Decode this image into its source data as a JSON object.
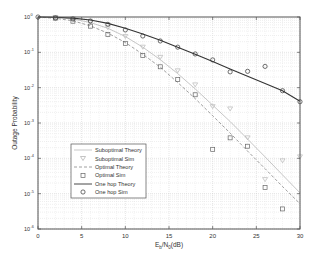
{
  "chart_data": {
    "type": "line",
    "title": "",
    "xlabel": "E_b/N_0(dB)",
    "ylabel": "Outage Probability",
    "xlim": [
      0,
      30
    ],
    "ylim_log10": [
      -6,
      0
    ],
    "yscale": "log",
    "grid": true,
    "legend_position": "lower left (inside)",
    "x_ticks": [
      0,
      5,
      10,
      15,
      20,
      25,
      30
    ],
    "y_ticks": [
      "10^0",
      "10^-1",
      "10^-2",
      "10^-3",
      "10^-4",
      "10^-5",
      "10^-6"
    ],
    "series": [
      {
        "name": "Suboptimal Theory",
        "style": "solid-light",
        "color": "#b8b8b8",
        "x": [
          0,
          2,
          4,
          6,
          8,
          10,
          12,
          14,
          16,
          18,
          20,
          22,
          24,
          26,
          28,
          30
        ],
        "y": [
          1.0,
          0.97,
          0.88,
          0.7,
          0.48,
          0.28,
          0.14,
          0.062,
          0.025,
          0.0092,
          0.0032,
          0.0011,
          0.00035,
          0.00011,
          3.4e-05,
          1.05e-05
        ]
      },
      {
        "name": "Suboptimal Sim",
        "style": "marker-triangle-down",
        "color": "#b8b8b8",
        "x": [
          2,
          4,
          6,
          8,
          10,
          12,
          14,
          16,
          18,
          20,
          22,
          24,
          26,
          28,
          30
        ],
        "y": [
          0.97,
          0.88,
          0.72,
          0.5,
          0.28,
          0.14,
          0.072,
          0.03,
          0.012,
          0.0029,
          0.0025,
          0.00038,
          2.5e-05,
          8.5e-05,
          0.00011
        ]
      },
      {
        "name": "Optimal Theory",
        "style": "dashed",
        "color": "#888888",
        "x": [
          0,
          2,
          4,
          6,
          8,
          10,
          12,
          14,
          16,
          18,
          20,
          22,
          24,
          26,
          28,
          30
        ],
        "y": [
          1.0,
          0.92,
          0.78,
          0.56,
          0.35,
          0.19,
          0.088,
          0.038,
          0.014,
          0.0049,
          0.0016,
          0.00052,
          0.00016,
          5.1e-05,
          1.6e-05,
          5.2e-06
        ]
      },
      {
        "name": "Optimal Sim",
        "style": "marker-square",
        "color": "#666666",
        "x": [
          2,
          4,
          6,
          8,
          10,
          12,
          14,
          16,
          18,
          20,
          22,
          24,
          26,
          28
        ],
        "y": [
          0.93,
          0.76,
          0.55,
          0.32,
          0.18,
          0.082,
          0.039,
          0.017,
          0.0063,
          0.00018,
          0.00038,
          0.00022,
          1.5e-05,
          3.7e-06
        ]
      },
      {
        "name": "One hop Theory",
        "style": "solid-dark",
        "color": "#333333",
        "x": [
          0,
          2,
          4,
          6,
          8,
          10,
          12,
          14,
          16,
          18,
          20,
          22,
          24,
          26,
          28,
          30
        ],
        "y": [
          1.0,
          0.98,
          0.93,
          0.82,
          0.66,
          0.48,
          0.33,
          0.22,
          0.14,
          0.088,
          0.055,
          0.034,
          0.021,
          0.013,
          0.0082,
          0.0041
        ]
      },
      {
        "name": "One hop Sim",
        "style": "marker-circle",
        "color": "#333333",
        "x": [
          0,
          2,
          4,
          6,
          8,
          10,
          12,
          14,
          16,
          18,
          20,
          22,
          24,
          26,
          28,
          30
        ],
        "y": [
          1.0,
          0.94,
          0.88,
          0.77,
          0.62,
          0.43,
          0.29,
          0.21,
          0.14,
          0.09,
          0.061,
          0.028,
          0.029,
          0.04,
          0.0082,
          0.004
        ]
      }
    ]
  },
  "axes": {
    "xlabel_main": "E",
    "xlabel_sub1": "b",
    "xlabel_mid": "/N",
    "xlabel_sub2": "0",
    "xlabel_tail": "(dB)",
    "ylabel": "Outage Probability"
  },
  "legend": {
    "items": [
      {
        "label": "Suboptimal Theory"
      },
      {
        "label": "Suboptimal Sim"
      },
      {
        "label": "Optimal Theory"
      },
      {
        "label": "Optimal Sim"
      },
      {
        "label": "One hop Theory"
      },
      {
        "label": "One hop Sim"
      }
    ]
  }
}
